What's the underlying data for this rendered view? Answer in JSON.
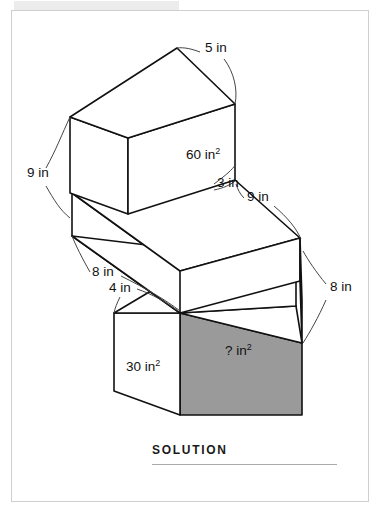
{
  "page": {
    "frame_border_color": "#cfcfcf",
    "background": "#ffffff"
  },
  "figure": {
    "stroke_color": "#111111",
    "shaded_face_color": "#9a9a9a",
    "unshaded_face_color": "#ffffff",
    "dimension_labels": [
      {
        "id": "top-length",
        "text": "5 in",
        "x": 205,
        "y": 52
      },
      {
        "id": "top-height",
        "text": "9 in",
        "x": 27,
        "y": 177
      },
      {
        "id": "middle-height",
        "text": "3 in",
        "x": 217,
        "y": 187
      },
      {
        "id": "middle-depth",
        "text": "9 in",
        "x": 247,
        "y": 201
      },
      {
        "id": "middle-length",
        "text": "8 in",
        "x": 92,
        "y": 276
      },
      {
        "id": "bottom-depth",
        "text": "4 in",
        "x": 109,
        "y": 292
      },
      {
        "id": "bottom-height",
        "text": "8 in",
        "x": 330,
        "y": 291
      }
    ],
    "face_area_labels": [
      {
        "id": "top-face-area",
        "text": "60 in",
        "exponent": "2",
        "x": 186,
        "y": 159,
        "shaded": false
      },
      {
        "id": "left-face-area",
        "text": "30 in",
        "exponent": "2",
        "x": 126,
        "y": 371,
        "shaded": false
      },
      {
        "id": "unknown-face-area",
        "text": "? in",
        "exponent": "2",
        "x": 225,
        "y": 355,
        "shaded": true
      }
    ]
  },
  "solution": {
    "heading": "SOLUTION"
  }
}
